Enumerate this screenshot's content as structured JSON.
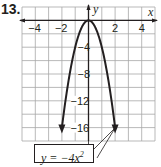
{
  "problem_number": "13.",
  "equation": {
    "prefix": "y =  −4x",
    "exponent": "2"
  },
  "chart_data": {
    "type": "line",
    "title": "",
    "function": "y = -4x^2",
    "xlabel": "x",
    "ylabel": "y",
    "xlim": [
      -5,
      5
    ],
    "ylim": [
      -18,
      2
    ],
    "x_ticks": [
      -4,
      -2,
      2,
      4
    ],
    "y_ticks": [
      -4,
      -8,
      -12,
      -16
    ],
    "grid": true,
    "grid_step_x": 1,
    "grid_step_y": 2,
    "series": [
      {
        "name": "y = -4x^2",
        "x": [
          -2,
          -1.5,
          -1,
          -0.5,
          0,
          0.5,
          1,
          1.5,
          2
        ],
        "y": [
          -16,
          -9,
          -4,
          -1,
          0,
          -1,
          -4,
          -9,
          -16
        ],
        "arrows_at_ends": true
      }
    ],
    "annotations": [
      {
        "text": "y = -4x^2",
        "points_to": [
          [
            0,
            -18
          ],
          [
            2,
            -16
          ]
        ]
      }
    ]
  },
  "colors": {
    "ink": "#231f20",
    "grid": "#9a9a9a"
  }
}
